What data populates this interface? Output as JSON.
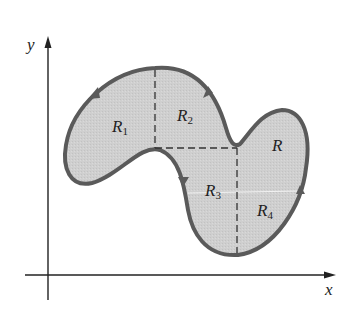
{
  "diagram": {
    "axes": {
      "x_label": "x",
      "y_label": "y"
    },
    "region_label": "R",
    "subregions": [
      {
        "name": "R",
        "sub": "1"
      },
      {
        "name": "R",
        "sub": "2"
      },
      {
        "name": "R",
        "sub": "3"
      },
      {
        "name": "R",
        "sub": "4"
      }
    ],
    "colors": {
      "fill": "#cfcfcf",
      "boundary": "#5a5a5a",
      "axis": "#222222",
      "dashed": "#333333"
    }
  }
}
